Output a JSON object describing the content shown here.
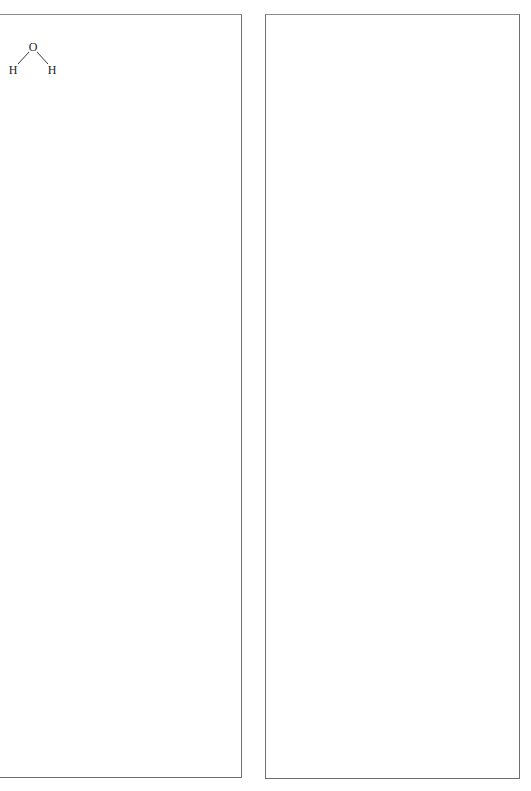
{
  "panels": {
    "left": {
      "molecule": {
        "name": "water",
        "atoms": [
          {
            "symbol": "O",
            "x": 33,
            "y": 47
          },
          {
            "symbol": "H",
            "x": 13,
            "y": 70
          },
          {
            "symbol": "H",
            "x": 52,
            "y": 70
          }
        ],
        "bonds": [
          {
            "from": 0,
            "to": 1
          },
          {
            "from": 0,
            "to": 2
          }
        ]
      }
    },
    "right": {}
  },
  "colors": {
    "border": "#6e6e6e",
    "bond": "#333333",
    "atom_text": "#222222",
    "background": "#ffffff"
  }
}
